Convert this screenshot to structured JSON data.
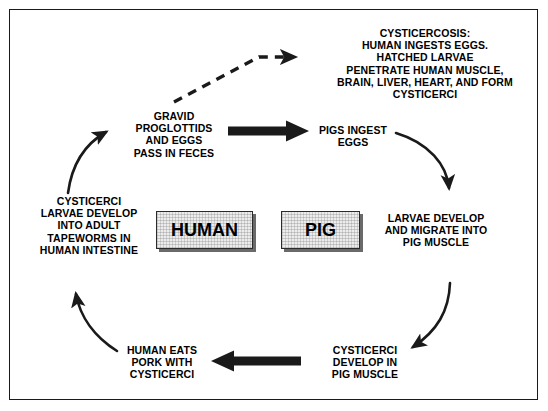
{
  "figure": {
    "border_color": "#1a1a1a",
    "background_color": "#ffffff",
    "text_color": "#000000",
    "arrow_color": "#1a1a1a",
    "box_fill_color": "#ececec",
    "box_shadow_color": "#6a6a6a"
  },
  "nodes": {
    "cysticercosis": {
      "label": "CYSTICERCOSIS:\nHUMAN INGESTS EGGS.\nHATCHED LARVAE\nPENETRATE HUMAN MUSCLE,\nBRAIN, LIVER, HEART, AND FORM\nCYSTICERCI",
      "font_size": "10.5px"
    },
    "gravid_proglottids": {
      "label": "GRAVID\nPROGLOTTIDS\nAND EGGS\nPASS IN FECES",
      "font_size": "10.5px"
    },
    "pigs_ingest_eggs": {
      "label": "PIGS INGEST\nEGGS",
      "font_size": "10.5px"
    },
    "larvae_migrate": {
      "label": "LARVAE DEVELOP\nAND MIGRATE INTO\nPIG MUSCLE",
      "font_size": "10.5px"
    },
    "cysticerci_pig_muscle": {
      "label": "CYSTICERCI\nDEVELOP IN\nPIG MUSCLE",
      "font_size": "10.5px"
    },
    "human_eats_pork": {
      "label": "HUMAN EATS\nPORK WITH\nCYSTICERCI",
      "font_size": "10.5px"
    },
    "cysticerci_tapeworms": {
      "label": "CYSTICERCI\nLARVAE DEVELOP\nINTO ADULT\nTAPEWORMS IN\nHUMAN INTESTINE",
      "font_size": "10.5px"
    },
    "human_box": {
      "label": "HUMAN",
      "font_size": "18px"
    },
    "pig_box": {
      "label": "PIG",
      "font_size": "18px"
    }
  },
  "connectors": [
    {
      "name": "dashed-arrow-to-cysticercosis",
      "style": "dashed",
      "weight": "medium",
      "from": "gravid_proglottids",
      "to": "cysticercosis"
    },
    {
      "name": "thick-arrow-feces-to-pigs",
      "style": "solid-thick",
      "weight": "thick",
      "from": "gravid_proglottids",
      "to": "pigs_ingest_eggs"
    },
    {
      "name": "curve-tapeworms-to-proglottids",
      "style": "curve",
      "weight": "thin",
      "from": "cysticerci_tapeworms",
      "to": "gravid_proglottids"
    },
    {
      "name": "curve-pigs-to-larvae",
      "style": "curve",
      "weight": "thin",
      "from": "pigs_ingest_eggs",
      "to": "larvae_migrate"
    },
    {
      "name": "curve-larvae-to-cysticerci-pig",
      "style": "curve",
      "weight": "thin",
      "from": "larvae_migrate",
      "to": "cysticerci_pig_muscle"
    },
    {
      "name": "thick-arrow-pork-to-human",
      "style": "solid-thick",
      "weight": "thick",
      "from": "cysticerci_pig_muscle",
      "to": "human_eats_pork"
    },
    {
      "name": "curve-pork-to-tapeworms",
      "style": "curve",
      "weight": "thin",
      "from": "human_eats_pork",
      "to": "cysticerci_tapeworms"
    }
  ]
}
